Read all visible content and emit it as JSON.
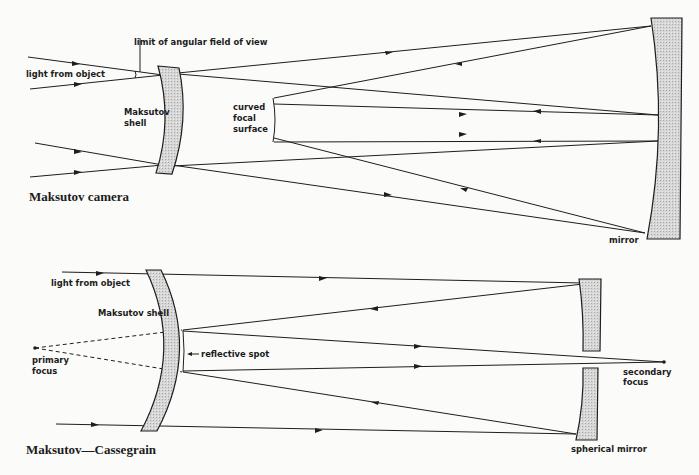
{
  "figures": [
    {
      "id": "maksutov-camera",
      "title": "Maksutov camera",
      "labels": {
        "light_from_object": "light from object",
        "limit_of_field": "limit of angular field of view",
        "shell_line1": "Maksutov",
        "shell_line2": "shell",
        "focal_line1": "curved",
        "focal_line2": "focal",
        "focal_line3": "surface",
        "mirror": "mirror"
      }
    },
    {
      "id": "maksutov-cassegrain",
      "title": "Maksutov—Cassegrain",
      "labels": {
        "light_from_object": "light from object",
        "shell": "Maksutov shell",
        "reflective_spot": "reflective spot",
        "primary_line1": "primary",
        "primary_line2": "focus",
        "secondary_line1": "secondary",
        "secondary_line2": "focus",
        "spherical_mirror": "spherical mirror"
      }
    }
  ],
  "colors": {
    "line": "#1e1e1e",
    "fill": "#d9d9d9",
    "background": "#fbfbf9"
  }
}
